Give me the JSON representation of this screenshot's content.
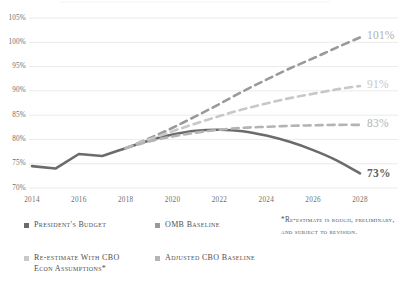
{
  "chart_data": {
    "type": "line",
    "title": "",
    "xlabel": "",
    "ylabel": "",
    "xlim": [
      2014,
      2028
    ],
    "ylim": [
      70,
      105
    ],
    "grid": true,
    "y_ticks": [
      "105%",
      "100%",
      "95%",
      "90%",
      "85%",
      "80%",
      "75%",
      "70%"
    ],
    "y_tick_values": [
      105,
      100,
      95,
      90,
      85,
      80,
      75,
      70
    ],
    "x_ticks": [
      "2014",
      "2016",
      "2018",
      "2020",
      "2022",
      "2024",
      "2026",
      "2028"
    ],
    "x_tick_values": [
      2014,
      2016,
      2018,
      2020,
      2022,
      2024,
      2026,
      2028
    ],
    "legend_position": "bottom-left",
    "series": [
      {
        "name": "President's Budget",
        "color": "#6b6b6b",
        "style": "solid",
        "end_label": "73%",
        "x": [
          2014,
          2015,
          2016,
          2017,
          2018,
          2019,
          2020,
          2021,
          2022,
          2023,
          2024,
          2025,
          2026,
          2027,
          2028
        ],
        "values": [
          74.5,
          74.0,
          77.0,
          76.6,
          78.2,
          79.8,
          81.0,
          81.8,
          82.0,
          81.7,
          80.8,
          79.5,
          77.8,
          75.7,
          73.0
        ]
      },
      {
        "name": "OMB Baseline",
        "color": "#9a9a9a",
        "style": "dashed",
        "end_label": "101%",
        "x": [
          2018,
          2019,
          2020,
          2021,
          2022,
          2023,
          2024,
          2025,
          2026,
          2027,
          2028
        ],
        "values": [
          78.2,
          80.2,
          82.4,
          84.8,
          87.3,
          89.9,
          92.3,
          94.6,
          96.7,
          98.9,
          101.0
        ]
      },
      {
        "name": "Re-estimate With CBO\nEcon Assumptions*",
        "color": "#c8c8c8",
        "style": "dashed",
        "end_label": "91%",
        "x": [
          2018,
          2019,
          2020,
          2021,
          2022,
          2023,
          2024,
          2025,
          2026,
          2027,
          2028
        ],
        "values": [
          78.2,
          80.0,
          81.7,
          83.3,
          84.8,
          86.2,
          87.4,
          88.5,
          89.4,
          90.3,
          91.0
        ]
      },
      {
        "name": "Adjusted CBO Baseline",
        "color": "#b4b4b4",
        "style": "dashed",
        "end_label": "83%",
        "x": [
          2018,
          2019,
          2020,
          2021,
          2022,
          2023,
          2024,
          2025,
          2026,
          2027,
          2028
        ],
        "values": [
          78.2,
          79.6,
          80.6,
          81.4,
          82.0,
          82.4,
          82.6,
          82.8,
          82.9,
          83.0,
          83.0
        ]
      }
    ],
    "annotations": [
      {
        "text": "101%",
        "color": "#b0b0b0",
        "value": 101
      },
      {
        "text": "91%",
        "color": "#c8c8c8",
        "value": 91
      },
      {
        "text": "83%",
        "color": "#b4b4b4",
        "value": 83
      },
      {
        "text": "73%",
        "color": "#5f5f5f",
        "value": 73
      }
    ]
  },
  "legend": {
    "items": [
      {
        "label": "President's Budget",
        "color": "#6b6b6b"
      },
      {
        "label": "OMB Baseline",
        "color": "#9a9a9a"
      },
      {
        "label": "Re-estimate With CBO\nEcon Assumptions*",
        "color": "#c8c8c8"
      },
      {
        "label": "Adjusted CBO Baseline",
        "color": "#b4b4b4"
      }
    ]
  },
  "footnote": {
    "text": "*Re-estimate is rough, preliminary, and subject to revision."
  },
  "colors": {
    "gridline": "#e6e6e6",
    "axis_text": "#6e6e6e",
    "legend_text": "#4f4f4f"
  }
}
